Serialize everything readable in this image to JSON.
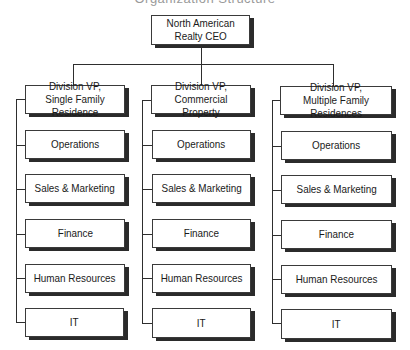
{
  "caption": "Organization Structure",
  "ceo": {
    "label": "North American\nRealty CEO"
  },
  "divisions": [
    {
      "label": "Division VP,\nSingle Family Residence",
      "departments": [
        "Operations",
        "Sales & Marketing",
        "Finance",
        "Human Resources",
        "IT"
      ]
    },
    {
      "label": "Division VP,\nCommercial Property",
      "departments": [
        "Operations",
        "Sales & Marketing",
        "Finance",
        "Human Resources",
        "IT"
      ]
    },
    {
      "label": "Division VP,\nMultiple Family Residences",
      "departments": [
        "Operations",
        "Sales & Marketing",
        "Finance",
        "Human Resources",
        "IT"
      ]
    }
  ],
  "colors": {
    "line": "#2e2e2e",
    "shadow": "#2b2b2b",
    "box_fill": "#ffffff"
  }
}
